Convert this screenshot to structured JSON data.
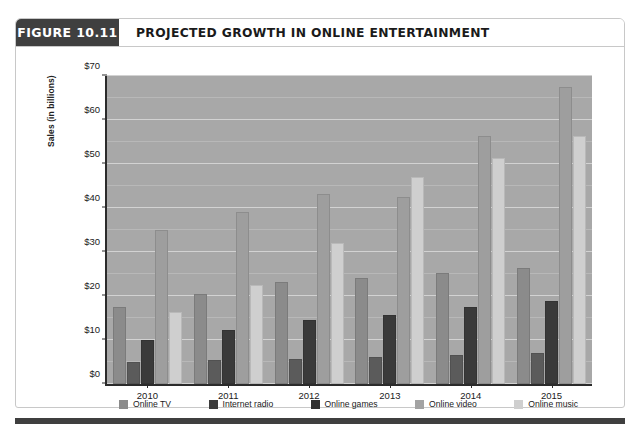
{
  "figure": {
    "number_label": "FIGURE 10.11",
    "title": "PROJECTED GROWTH IN ONLINE ENTERTAINMENT"
  },
  "chart_data": {
    "type": "bar",
    "title": "PROJECTED GROWTH IN ONLINE ENTERTAINMENT",
    "xlabel": "",
    "ylabel": "Sales (in billions)",
    "categories": [
      "2010",
      "2011",
      "2012",
      "2013",
      "2014",
      "2015"
    ],
    "series": [
      {
        "name": "Online TV",
        "color": "#8b8b8b",
        "values": [
          17.0,
          20.0,
          22.8,
          23.7,
          24.7,
          25.8
        ]
      },
      {
        "name": "Internet radio",
        "color": "#3d3d3d",
        "values": [
          4.5,
          5.0,
          5.2,
          5.7,
          6.2,
          6.7
        ]
      },
      {
        "name": "Online games",
        "color": "#2f2f2f",
        "values": [
          9.5,
          11.8,
          14.0,
          15.3,
          17.0,
          18.5
        ]
      },
      {
        "name": "Online video",
        "color": "#a3a3a3",
        "values": [
          34.5,
          38.6,
          42.7,
          42.0,
          56.0,
          67.0
        ]
      },
      {
        "name": "Online music",
        "color": "#cfcfcf",
        "values": [
          16.0,
          22.0,
          31.7,
          46.5,
          51.0,
          56.0
        ]
      }
    ],
    "ylim": [
      0,
      70
    ],
    "ytick_values": [
      0,
      10,
      20,
      30,
      40,
      50,
      60,
      70
    ],
    "ytick_labels": [
      "$0",
      "$10",
      "$20",
      "$30",
      "$40",
      "$50",
      "$60",
      "$70"
    ],
    "minor_tick_step": 5,
    "grid": true,
    "legend_position": "bottom",
    "legend_entries": [
      "Online TV",
      "Internet radio",
      "Online games",
      "Online video",
      "Online music"
    ],
    "plot_background": "#a8a8a8",
    "gridline_color": "#d2d2d2"
  }
}
